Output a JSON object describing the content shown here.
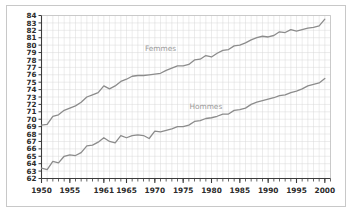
{
  "chart_data": {
    "type": "line",
    "title": "",
    "subtitle": "",
    "xlabel": "",
    "ylabel": "",
    "xlim": [
      1950,
      2001
    ],
    "ylim": [
      62,
      84
    ],
    "grid": true,
    "legend_position": "inline-annotations",
    "y_ticks": [
      62,
      63,
      64,
      65,
      66,
      67,
      68,
      69,
      70,
      71,
      72,
      73,
      74,
      75,
      76,
      77,
      78,
      79,
      80,
      81,
      82,
      83,
      84
    ],
    "y_tick_labels": [
      "62",
      "63",
      "64",
      "65",
      "66",
      "67",
      "68",
      "69",
      "70",
      "71",
      "72",
      "73",
      "74",
      "75",
      "76",
      "77",
      "78",
      "79",
      "80",
      "81",
      "82",
      "83",
      "84"
    ],
    "x_ticks": [
      1950,
      1955,
      1961,
      1965,
      1970,
      1975,
      1980,
      1985,
      1990,
      1995,
      2000
    ],
    "x_tick_labels": [
      "1950",
      "1955",
      "1961",
      "1965",
      "1970",
      "1975",
      "1980",
      "1985",
      "1990",
      "1995",
      "2000"
    ],
    "x_minor_tick_step": 1,
    "annotations": [
      {
        "text": "Femmes",
        "x": 1971,
        "y": 79.2,
        "color": "#9a9a9a"
      },
      {
        "text": "Hommes",
        "x": 1979,
        "y": 71.4,
        "color": "#9a9a9a"
      }
    ],
    "line_color": "#8c8c8c",
    "grid_color": "#d9d9d9",
    "axis_color": "#3c3c3c",
    "x": [
      1950,
      1951,
      1952,
      1953,
      1954,
      1955,
      1956,
      1957,
      1958,
      1959,
      1960,
      1961,
      1962,
      1963,
      1964,
      1965,
      1966,
      1967,
      1968,
      1969,
      1970,
      1971,
      1972,
      1973,
      1974,
      1975,
      1976,
      1977,
      1978,
      1979,
      1980,
      1981,
      1982,
      1983,
      1984,
      1985,
      1986,
      1987,
      1988,
      1989,
      1990,
      1991,
      1992,
      1993,
      1994,
      1995,
      1996,
      1997,
      1998,
      1999,
      2000
    ],
    "series": [
      {
        "name": "Femmes",
        "values": [
          69.2,
          69.3,
          70.4,
          70.6,
          71.2,
          71.5,
          71.8,
          72.3,
          73.0,
          73.3,
          73.6,
          74.5,
          74.1,
          74.5,
          75.1,
          75.4,
          75.8,
          75.9,
          75.9,
          76.0,
          76.1,
          76.2,
          76.6,
          76.9,
          77.2,
          77.2,
          77.4,
          78.0,
          78.1,
          78.6,
          78.4,
          78.9,
          79.3,
          79.4,
          79.9,
          80.0,
          80.3,
          80.7,
          81.0,
          81.2,
          81.1,
          81.3,
          81.8,
          81.7,
          82.1,
          81.9,
          82.1,
          82.3,
          82.4,
          82.6,
          83.5
        ]
      },
      {
        "name": "Hommes",
        "values": [
          63.4,
          63.2,
          64.3,
          64.1,
          65.0,
          65.2,
          65.1,
          65.5,
          66.4,
          66.5,
          66.9,
          67.5,
          67.0,
          66.8,
          67.8,
          67.5,
          67.8,
          67.9,
          67.8,
          67.4,
          68.4,
          68.3,
          68.5,
          68.7,
          69.0,
          69.0,
          69.2,
          69.7,
          69.8,
          70.1,
          70.2,
          70.4,
          70.7,
          70.7,
          71.2,
          71.3,
          71.5,
          72.0,
          72.3,
          72.5,
          72.7,
          72.9,
          73.2,
          73.3,
          73.6,
          73.8,
          74.1,
          74.5,
          74.7,
          74.9,
          75.5
        ]
      }
    ]
  }
}
